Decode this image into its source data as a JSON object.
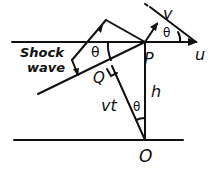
{
  "diagram": {
    "labels": {
      "shock_wave_line1": "Shock",
      "shock_wave_line2": "wave",
      "theta_left": "θ",
      "theta_top_right": "θ",
      "theta_bottom": "θ",
      "point_p": "P",
      "point_q": "Q",
      "point_o": "O",
      "velocity_u": "u",
      "velocity_v": "v",
      "distance_h": "h",
      "distance_vt": "vt"
    },
    "stroke_color": "#111111",
    "background": "#ffffff"
  }
}
